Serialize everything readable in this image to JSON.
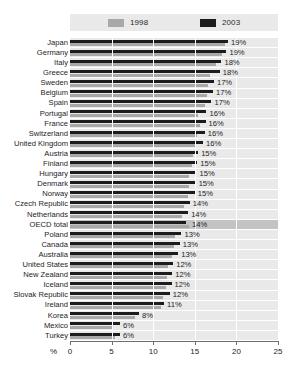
{
  "chart_data": {
    "type": "bar",
    "orientation": "horizontal",
    "title": "",
    "xlabel": "%",
    "ylabel": "",
    "xlim": [
      0,
      25
    ],
    "xticks": [
      0,
      5,
      10,
      15,
      20,
      25
    ],
    "grid": true,
    "legend_position": "top",
    "series": [
      {
        "name": "1998",
        "color": "#a8a8a8",
        "values": [
          18.6,
          18.3,
          17.6,
          16.8,
          16.6,
          16.5,
          16.2,
          15.4,
          15.6,
          15.3,
          15.0,
          14.8,
          14.7,
          14.3,
          14.3,
          14.2,
          13.7,
          13.5,
          14.3,
          12.6,
          12.5,
          12.3,
          11.8,
          11.6,
          11.5,
          11.2,
          10.9,
          7.8,
          5.2,
          5.4
        ]
      },
      {
        "name": "2003",
        "color": "#1c1c1c",
        "values": [
          19.0,
          18.8,
          18.2,
          18.0,
          17.3,
          17.2,
          17.0,
          16.4,
          16.3,
          16.2,
          16.0,
          15.4,
          15.3,
          15.2,
          15.1,
          15.0,
          14.4,
          14.2,
          14.0,
          13.4,
          13.2,
          13.0,
          12.4,
          12.3,
          12.2,
          12.0,
          11.3,
          8.3,
          6.0,
          6.0
        ]
      }
    ],
    "categories": [
      "Japan",
      "Germany",
      "Italy",
      "Greece",
      "Sweden",
      "Belgium",
      "Spain",
      "Portugal",
      "France",
      "Switzerland",
      "United Kingdom",
      "Austria",
      "Finland",
      "Hungary",
      "Denmark",
      "Norway",
      "Czech Republic",
      "Netherlands",
      "OECD total",
      "Poland",
      "Canada",
      "Australia",
      "United States",
      "New Zealand",
      "Iceland",
      "Slovak Republic",
      "Ireland",
      "Korea",
      "Mexico",
      "Turkey"
    ],
    "data_labels": [
      "19%",
      "19%",
      "18%",
      "18%",
      "17%",
      "17%",
      "17%",
      "16%",
      "16%",
      "16%",
      "16%",
      "15%",
      "15%",
      "15%",
      "15%",
      "15%",
      "14%",
      "14%",
      "14%",
      "13%",
      "13%",
      "13%",
      "12%",
      "12%",
      "12%",
      "12%",
      "11%",
      "8%",
      "6%",
      "6%"
    ],
    "highlight_category": "OECD total"
  },
  "legend": {
    "entries": [
      {
        "label": "1998",
        "color": "#a8a8a8"
      },
      {
        "label": "2003",
        "color": "#1c1c1c"
      }
    ]
  },
  "axis": {
    "unit": "%",
    "tick_labels": [
      "0",
      "5",
      "10",
      "15",
      "20",
      "25"
    ]
  }
}
